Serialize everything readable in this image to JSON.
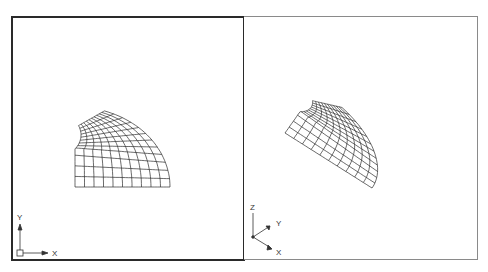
{
  "viewports": [
    {
      "id": "left",
      "view": "plan",
      "active": true,
      "ucs_icon": {
        "type": "2d",
        "x_label": "X",
        "y_label": "Y"
      }
    },
    {
      "id": "right",
      "view": "isometric",
      "active": false,
      "ucs_icon": {
        "type": "3d",
        "x_label": "X",
        "y_label": "Y",
        "z_label": "Z"
      }
    }
  ],
  "mesh": {
    "color": "#2b2b2b",
    "radial_divisions": 12,
    "ring_divisions": 10,
    "plan_origin": [
      75,
      187
    ],
    "outer_rx": 95,
    "outer_ry": 80,
    "outer_end_angle_deg": 72,
    "notch_center": [
      62,
      135
    ],
    "notch_radius": 19,
    "iso_origin": [
      285,
      133
    ],
    "iso_u": [
      0.916,
      0.579
    ],
    "iso_v": [
      0.396,
      -0.559
    ]
  }
}
